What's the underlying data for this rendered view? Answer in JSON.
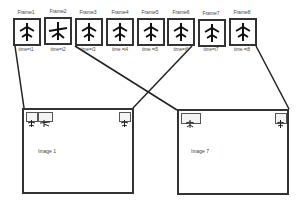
{
  "frames": [
    {
      "label": "Frame1",
      "time": "time=t1"
    },
    {
      "label": "Frame2",
      "time": "time=t2"
    },
    {
      "label": "Frame3",
      "time": "time=t3"
    },
    {
      "label": "Frame4",
      "time": "time =t4"
    },
    {
      "label": "Frame5",
      "time": "time =t5"
    },
    {
      "label": "Frame6",
      "time": "time=t6"
    },
    {
      "label": "Frame7",
      "time": "time=t7"
    },
    {
      "label": "Frame8",
      "time": "time =t8"
    }
  ],
  "images": [
    {
      "label": "Image 1"
    },
    {
      "label": "Image 7"
    }
  ],
  "icon": "plane-icon"
}
